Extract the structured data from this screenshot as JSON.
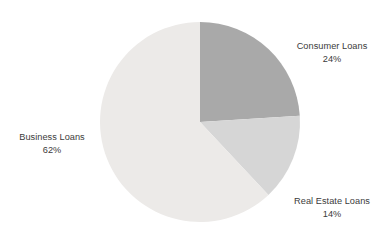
{
  "chart_data": {
    "type": "pie",
    "title": "",
    "subtitle": "",
    "xlabel": "",
    "ylabel": "",
    "legend_position": "none",
    "grid": false,
    "labels_position": "outside",
    "total_percent": "100%",
    "categories": [
      "Consumer Loans",
      "Real Estate Loans",
      "Business Loans"
    ],
    "values": [
      24,
      14,
      62
    ],
    "slices": [
      {
        "name": "Consumer Loans",
        "value": 24,
        "value_label": "24%",
        "color": "#a9a9a9",
        "start_angle_deg": 0,
        "end_angle_deg": 86.4
      },
      {
        "name": "Real Estate Loans",
        "value": 14,
        "value_label": "14%",
        "color": "#d6d6d6",
        "start_angle_deg": 86.4,
        "end_angle_deg": 136.8
      },
      {
        "name": "Business Loans",
        "value": 62,
        "value_label": "62%",
        "color": "#eceae8",
        "start_angle_deg": 136.8,
        "end_angle_deg": 360
      }
    ],
    "geometry": {
      "center_x": 200,
      "center_y": 122,
      "radius": 100,
      "start_at_twelve_oclock": true,
      "direction": "clockwise"
    },
    "colors": {
      "background": "#ffffff",
      "text": "#3b3b3b",
      "consumer_loans": "#a9a9a9",
      "real_estate_loans": "#d6d6d6",
      "business_loans": "#eceae8"
    }
  }
}
